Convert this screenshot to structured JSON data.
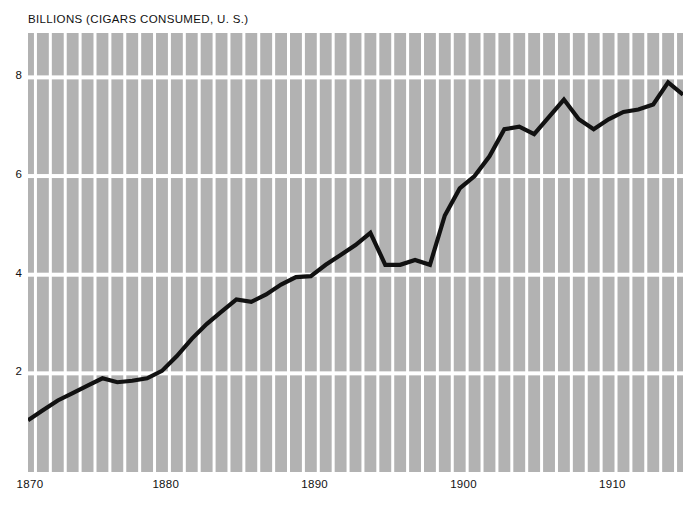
{
  "chart_data": {
    "type": "line",
    "title": "BILLIONS (CIGARS CONSUMED, U. S.)",
    "xlabel": "",
    "ylabel": "BILLIONS",
    "xlim": [
      1870,
      1914
    ],
    "ylim": [
      0,
      8.9
    ],
    "grid": "vertical white bands per year; horizontal white lines at even values",
    "legend": "none",
    "x_ticks": [
      1870,
      1880,
      1890,
      1900,
      1910
    ],
    "x_tick_labels": [
      "1870",
      "1880",
      "1890",
      "1900",
      "1910"
    ],
    "y_ticks": [
      2,
      4,
      6,
      8
    ],
    "y_tick_labels": [
      "2",
      "4",
      "6",
      "8"
    ],
    "series": [
      {
        "name": "Cigars consumed, U.S.",
        "x": [
          1870,
          1871,
          1872,
          1873,
          1874,
          1875,
          1876,
          1877,
          1878,
          1879,
          1880,
          1881,
          1882,
          1883,
          1884,
          1885,
          1886,
          1887,
          1888,
          1889,
          1890,
          1891,
          1892,
          1893,
          1894,
          1895,
          1896,
          1897,
          1898,
          1899,
          1900,
          1901,
          1902,
          1903,
          1904,
          1905,
          1906,
          1907,
          1908,
          1909,
          1910,
          1911,
          1912,
          1913,
          1914
        ],
        "values": [
          1.05,
          1.25,
          1.45,
          1.6,
          1.75,
          1.9,
          1.82,
          1.85,
          1.9,
          2.05,
          2.35,
          2.7,
          3.0,
          3.25,
          3.5,
          3.45,
          3.6,
          3.8,
          3.95,
          3.97,
          4.2,
          4.4,
          4.6,
          4.85,
          4.2,
          4.2,
          4.3,
          4.2,
          5.2,
          5.75,
          6.0,
          6.4,
          6.95,
          7.0,
          6.85,
          7.2,
          7.55,
          7.15,
          6.95,
          7.15,
          7.3,
          7.35,
          7.45,
          7.9,
          7.65
        ]
      }
    ]
  },
  "colors": {
    "band": "#b2b2b2",
    "gridline": "#ffffff",
    "line": "#111111",
    "text": "#111111",
    "background": "#ffffff"
  },
  "axis": {
    "y_labels": [
      "8",
      "6",
      "4",
      "2"
    ],
    "x_labels": [
      "1870",
      "1880",
      "1890",
      "1900",
      "1910"
    ]
  }
}
